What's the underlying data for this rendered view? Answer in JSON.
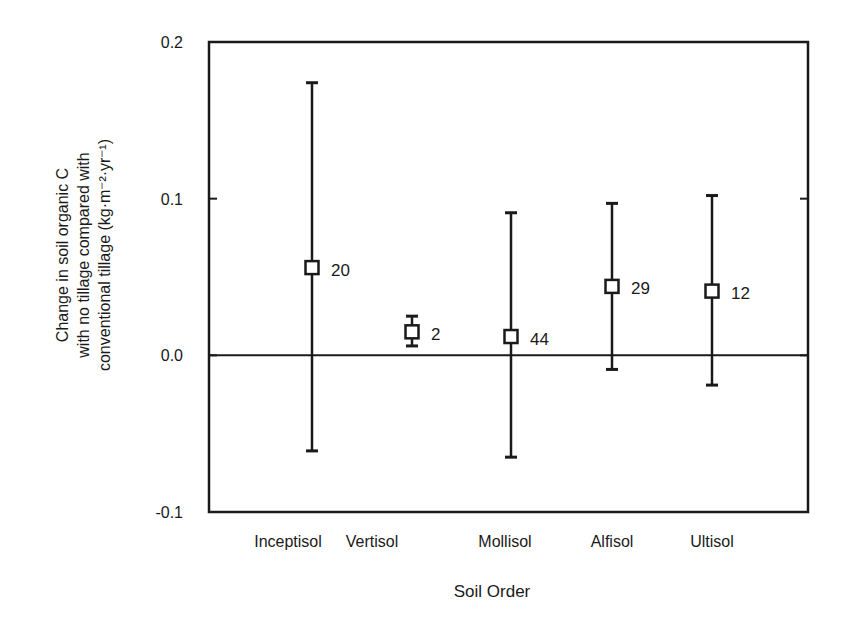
{
  "chart_data": {
    "type": "scatter",
    "subtype": "point-with-error-bars",
    "title": "",
    "xlabel": "Soil Order",
    "ylabel_lines": [
      "Change in soil organic C",
      "with no tillage compared with",
      "conventional tillage (kg·m⁻²·yr⁻¹)"
    ],
    "ylim": [
      -0.1,
      0.2
    ],
    "yticks": [
      {
        "value": 0.2,
        "label": "0.2"
      },
      {
        "value": 0.1,
        "label": "0.1"
      },
      {
        "value": 0.0,
        "label": "0.0"
      },
      {
        "value": -0.1,
        "label": "-0.1"
      }
    ],
    "grid": false,
    "reference_line": {
      "y": 0.0
    },
    "categories": [
      "Inceptisol",
      "Vertisol",
      "Mollisol",
      "Alfisol",
      "Ultisol"
    ],
    "series": [
      {
        "name": "Mean change in soil organic C",
        "marker": "open-square",
        "values": [
          0.056,
          0.015,
          0.012,
          0.044,
          0.041
        ],
        "error_low": [
          -0.061,
          0.006,
          -0.065,
          -0.009,
          -0.019
        ],
        "error_high": [
          0.174,
          0.025,
          0.091,
          0.097,
          0.102
        ],
        "annotations": [
          "20",
          "2",
          "44",
          "29",
          "12"
        ]
      }
    ]
  },
  "colors": {
    "ink": "#1a1a1a",
    "background": "#ffffff"
  }
}
